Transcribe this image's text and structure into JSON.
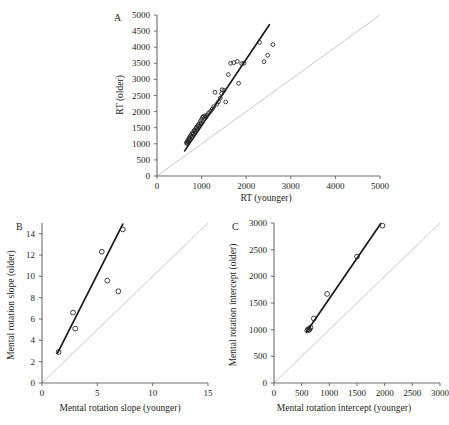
{
  "figure": {
    "panels": [
      "A",
      "B",
      "C"
    ],
    "marker_style": "open-circle",
    "fit_line_color": "#1a1a1a",
    "identity_line_color": "#c8c9cb"
  },
  "panelA": {
    "letter": "A",
    "xlabel": "RT (younger)",
    "ylabel": "RT (older)"
  },
  "panelB": {
    "letter": "B",
    "xlabel": "Mental rotation slope (younger)",
    "ylabel": "Mental rotation slope (older)"
  },
  "panelC": {
    "letter": "C",
    "xlabel": "Mental rotation intercept (younger)",
    "ylabel": "Mental rotation intercept (older)"
  },
  "chart_data": [
    {
      "type": "scatter",
      "panel": "A",
      "title": "",
      "xlabel": "RT (younger)",
      "ylabel": "RT (older)",
      "xlim": [
        0,
        5000
      ],
      "ylim": [
        0,
        5000
      ],
      "xticks": [
        0,
        1000,
        2000,
        3000,
        4000,
        5000
      ],
      "yticks": [
        0,
        500,
        1000,
        1500,
        2000,
        2500,
        3000,
        3500,
        4000,
        4500,
        5000
      ],
      "grid": false,
      "legend": "none",
      "points": [
        [
          660,
          1020
        ],
        [
          670,
          1060
        ],
        [
          680,
          1010
        ],
        [
          690,
          1100
        ],
        [
          700,
          1060
        ],
        [
          710,
          1140
        ],
        [
          720,
          1180
        ],
        [
          730,
          1120
        ],
        [
          745,
          1230
        ],
        [
          760,
          1260
        ],
        [
          775,
          1300
        ],
        [
          790,
          1210
        ],
        [
          800,
          1350
        ],
        [
          815,
          1310
        ],
        [
          830,
          1400
        ],
        [
          845,
          1430
        ],
        [
          860,
          1370
        ],
        [
          875,
          1480
        ],
        [
          890,
          1520
        ],
        [
          900,
          1440
        ],
        [
          915,
          1560
        ],
        [
          930,
          1600
        ],
        [
          945,
          1540
        ],
        [
          960,
          1640
        ],
        [
          975,
          1700
        ],
        [
          990,
          1620
        ],
        [
          1000,
          1760
        ],
        [
          1020,
          1820
        ],
        [
          1040,
          1850
        ],
        [
          1060,
          1790
        ],
        [
          1080,
          1870
        ],
        [
          1100,
          1830
        ],
        [
          1130,
          1900
        ],
        [
          1160,
          1960
        ],
        [
          1200,
          2010
        ],
        [
          1240,
          2080
        ],
        [
          1270,
          2150
        ],
        [
          1300,
          2600
        ],
        [
          1340,
          2230
        ],
        [
          1380,
          2310
        ],
        [
          1420,
          2420
        ],
        [
          1450,
          2560
        ],
        [
          1460,
          2680
        ],
        [
          1500,
          2660
        ],
        [
          1540,
          2300
        ],
        [
          1600,
          3150
        ],
        [
          1650,
          3500
        ],
        [
          1720,
          3520
        ],
        [
          1800,
          3560
        ],
        [
          1830,
          2880
        ],
        [
          1900,
          3490
        ],
        [
          1950,
          3500
        ],
        [
          2300,
          4150
        ],
        [
          2400,
          3550
        ],
        [
          2480,
          3750
        ],
        [
          2600,
          4080
        ]
      ],
      "fit_line": {
        "x": [
          620,
          2520
        ],
        "y": [
          780,
          4700
        ]
      },
      "identity_line": {
        "x": [
          0,
          5000
        ],
        "y": [
          0,
          5000
        ]
      }
    },
    {
      "type": "scatter",
      "panel": "B",
      "title": "",
      "xlabel": "Mental rotation slope (younger)",
      "ylabel": "Mental rotation slope (older)",
      "xlim": [
        0,
        15
      ],
      "ylim": [
        0,
        15
      ],
      "xticks": [
        0,
        5,
        10,
        15
      ],
      "yticks": [
        0,
        2,
        4,
        6,
        8,
        10,
        12,
        14
      ],
      "grid": false,
      "legend": "none",
      "points": [
        [
          1.5,
          2.9
        ],
        [
          2.8,
          6.6
        ],
        [
          3.0,
          5.1
        ],
        [
          5.4,
          12.3
        ],
        [
          5.9,
          9.6
        ],
        [
          6.9,
          8.6
        ],
        [
          7.3,
          14.4
        ]
      ],
      "fit_line": {
        "x": [
          1.4,
          7.3
        ],
        "y": [
          2.8,
          14.9
        ]
      },
      "identity_line": {
        "x": [
          0,
          15
        ],
        "y": [
          0,
          15
        ]
      }
    },
    {
      "type": "scatter",
      "panel": "C",
      "title": "",
      "xlabel": "Mental rotation intercept (younger)",
      "ylabel": "Mental rotation intercept (older)",
      "xlim": [
        0,
        3000
      ],
      "ylim": [
        0,
        3000
      ],
      "xticks": [
        0,
        500,
        1000,
        1500,
        2000,
        2500,
        3000
      ],
      "yticks": [
        0,
        500,
        1000,
        1500,
        2000,
        2500,
        3000
      ],
      "grid": false,
      "legend": "none",
      "points": [
        [
          600,
          985
        ],
        [
          620,
          1010
        ],
        [
          640,
          1000
        ],
        [
          660,
          1040
        ],
        [
          720,
          1210
        ],
        [
          960,
          1670
        ],
        [
          1500,
          2370
        ],
        [
          1960,
          2950
        ]
      ],
      "fit_line": {
        "x": [
          590,
          1930
        ],
        "y": [
          960,
          2990
        ]
      },
      "identity_line": {
        "x": [
          0,
          3000
        ],
        "y": [
          0,
          3000
        ]
      }
    }
  ]
}
